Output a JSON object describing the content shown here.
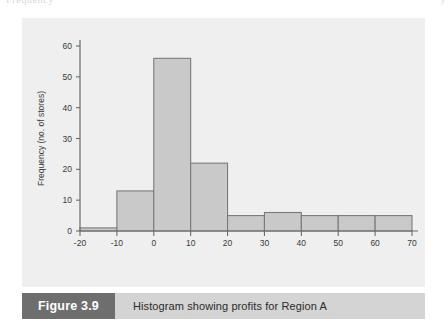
{
  "page": {
    "background_color": "#ffffff",
    "top_bleed_left": "Frequency",
    "top_bleed_right": ")"
  },
  "figure": {
    "panel_color": "#efefef",
    "number_label": "Figure 3.9",
    "number_block_color": "#6e6e6e",
    "caption": "Histogram showing profits for Region A",
    "caption_block_color": "#d4d4d4"
  },
  "chart_data": {
    "type": "bar",
    "title": "",
    "subtitle": "",
    "xlabel": "",
    "ylabel": "Frequency (no. of stores)",
    "xlim": [
      -20,
      70
    ],
    "ylim": [
      0,
      60
    ],
    "grid": false,
    "legend": "none",
    "bar_fill_color": "#c9c9c9",
    "bar_edge_color": "#7a7a7a",
    "axis_color": "#6b6b6b",
    "bin_width": 10,
    "bin_edges": [
      -20,
      -10,
      0,
      10,
      20,
      30,
      40,
      50,
      60,
      70
    ],
    "categories": [
      "-20 to -10",
      "-10 to 0",
      "0 to 10",
      "10 to 20",
      "20 to 30",
      "30 to 40",
      "40 to 50",
      "50 to 60",
      "60 to 70"
    ],
    "values": [
      1,
      13,
      56,
      22,
      5,
      6,
      5,
      5,
      5
    ],
    "xticks": [
      -20,
      -10,
      0,
      10,
      20,
      30,
      40,
      50,
      60,
      70
    ],
    "xtick_labels": [
      "-20",
      "-10",
      "0",
      "10",
      "20",
      "30",
      "40",
      "50",
      "60",
      "70"
    ],
    "yticks": [
      0,
      10,
      20,
      30,
      40,
      50,
      60
    ],
    "ytick_labels": [
      "0",
      "10",
      "20",
      "30",
      "40",
      "50",
      "60"
    ]
  }
}
